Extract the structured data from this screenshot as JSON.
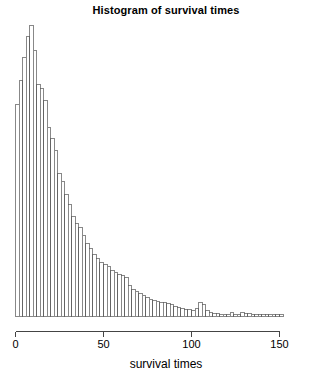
{
  "chart": {
    "title": "Histogram of survival times",
    "xlabel": "survival times"
  },
  "chart_data": {
    "type": "bar",
    "title": "Histogram of survival times",
    "xlabel": "survival times",
    "ylabel": "",
    "grid": false,
    "legend": null,
    "xlim": [
      0,
      153
    ],
    "ylim": [
      0,
      151
    ],
    "xticks": [
      0,
      50,
      100,
      150
    ],
    "xtick_labels": [
      "0",
      "50",
      "100",
      "150"
    ],
    "bin_width": 2,
    "bin_starts": [
      0,
      2,
      4,
      6,
      8,
      10,
      12,
      14,
      16,
      18,
      20,
      22,
      24,
      26,
      28,
      30,
      32,
      34,
      36,
      38,
      40,
      42,
      44,
      46,
      48,
      50,
      52,
      54,
      56,
      58,
      60,
      62,
      64,
      66,
      68,
      70,
      72,
      74,
      76,
      78,
      80,
      82,
      84,
      86,
      88,
      90,
      92,
      94,
      96,
      98,
      100,
      102,
      104,
      106,
      108,
      110,
      112,
      114,
      116,
      118,
      120,
      122,
      124,
      126,
      128,
      130,
      132,
      134,
      136,
      138,
      140,
      142,
      144,
      146,
      148,
      150
    ],
    "values": [
      110,
      122,
      134,
      145,
      151,
      138,
      120,
      118,
      112,
      98,
      92,
      86,
      74,
      70,
      63,
      58,
      52,
      48,
      46,
      42,
      38,
      35,
      32,
      30,
      28,
      27,
      26,
      24,
      23,
      22,
      21,
      20,
      16,
      14,
      13,
      12,
      11,
      10,
      9,
      8.5,
      8,
      7.5,
      7,
      6.5,
      6,
      5,
      4.5,
      4,
      3.5,
      3.5,
      3,
      4,
      7,
      6,
      3,
      2,
      1.5,
      1.5,
      1.2,
      1.2,
      1.2,
      2,
      1.2,
      1.2,
      2,
      1.5,
      1.5,
      1.2,
      1,
      1,
      0.8,
      0.8,
      0.8,
      1.2,
      0.8,
      1.2
    ]
  }
}
